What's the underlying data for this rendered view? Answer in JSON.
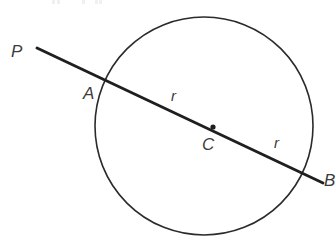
{
  "figure": {
    "kind": "geometry-diagram",
    "width": 336,
    "height": 247,
    "background_color": "#ffffff",
    "stroke_color": "#2b2b2b",
    "label_color": "#3c3c3c"
  },
  "labels": {
    "external_point": "P",
    "near_intersection": "A",
    "center": "C",
    "far_intersection": "B",
    "radius_left": "r",
    "radius_right": "r"
  },
  "geometry": {
    "circle": {
      "center_x": 204,
      "center_y": 126,
      "radius": 109,
      "stroke_width": 1.6
    },
    "center_dot": {
      "x": 213,
      "y": 127,
      "radius": 2.6
    },
    "secant_line": {
      "x1": 37,
      "y1": 48,
      "x2": 323,
      "y2": 183,
      "stroke_width": 2.9
    }
  },
  "artifacts": {
    "top_marks_x": [
      52,
      57,
      82,
      95,
      99
    ]
  }
}
